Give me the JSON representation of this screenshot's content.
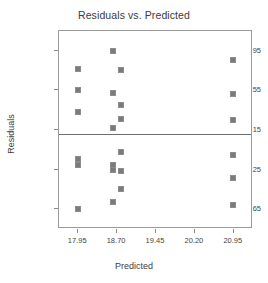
{
  "chart_data": {
    "type": "scatter",
    "title": "Residuals vs. Predicted",
    "xlabel": "Predicted",
    "ylabel": "Residuals",
    "xlim": [
      17.58,
      21.32
    ],
    "ylim": [
      -3.35,
      3.65
    ],
    "grid": false,
    "legend": null,
    "reference_line": {
      "orientation": "horizontal",
      "y": 0,
      "color": "#6e6e6e"
    },
    "xticks": [
      "17.95",
      "18.70",
      "19.45",
      "20.20",
      "20.95"
    ],
    "xtick_values": [
      17.95,
      18.7,
      19.45,
      20.2,
      20.95
    ],
    "yticks": [
      "2.95",
      "1.55",
      "0.15",
      "-1.25",
      "-2.65"
    ],
    "ytick_values": [
      2.95,
      1.55,
      0.15,
      -1.25,
      -2.65
    ],
    "marker": {
      "shape": "square",
      "fill": "#7a7a7a",
      "edge": "#8d8d8d",
      "size": 5
    },
    "points": [
      {
        "x": 17.95,
        "y": 2.3
      },
      {
        "x": 17.95,
        "y": 1.55
      },
      {
        "x": 17.95,
        "y": 0.8
      },
      {
        "x": 17.95,
        "y": -0.88
      },
      {
        "x": 17.95,
        "y": -1.08
      },
      {
        "x": 17.95,
        "y": -2.65
      },
      {
        "x": 18.63,
        "y": 2.95
      },
      {
        "x": 18.63,
        "y": 1.47
      },
      {
        "x": 18.63,
        "y": 0.23
      },
      {
        "x": 18.63,
        "y": -1.1
      },
      {
        "x": 18.63,
        "y": -1.28
      },
      {
        "x": 18.63,
        "y": -2.38
      },
      {
        "x": 18.78,
        "y": 2.28
      },
      {
        "x": 18.78,
        "y": 1.05
      },
      {
        "x": 18.78,
        "y": 0.53
      },
      {
        "x": 18.78,
        "y": -0.62
      },
      {
        "x": 18.78,
        "y": -1.3
      },
      {
        "x": 18.78,
        "y": -1.95
      },
      {
        "x": 20.93,
        "y": 2.62
      },
      {
        "x": 20.93,
        "y": 1.42
      },
      {
        "x": 20.93,
        "y": 0.52
      },
      {
        "x": 20.93,
        "y": -0.72
      },
      {
        "x": 20.93,
        "y": -1.55
      },
      {
        "x": 20.93,
        "y": -2.5
      }
    ]
  }
}
